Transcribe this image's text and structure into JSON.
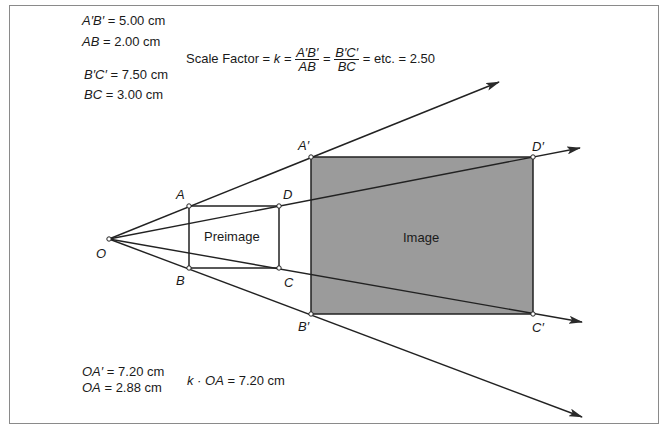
{
  "measurements": {
    "a_prime_b_prime": {
      "label": "A′B′",
      "value": "= 5.00 cm"
    },
    "ab": {
      "label": "AB",
      "value": "= 2.00 cm"
    },
    "b_prime_c_prime": {
      "label": "B′C′",
      "value": "= 7.50 cm"
    },
    "bc": {
      "label": "BC",
      "value": "= 3.00 cm"
    },
    "oa_prime": {
      "label": "OA′",
      "value": "= 7.20 cm"
    },
    "oa": {
      "label": "OA",
      "value": "= 2.88 cm"
    },
    "k_times_oa": {
      "label": "k · OA",
      "value": "= 7.20 cm"
    }
  },
  "scale_factor": {
    "prefix": "Scale Factor =",
    "k": "k",
    "eq": "=",
    "frac1_num": "A′B′",
    "frac1_den": "AB",
    "frac2_num": "B′C′",
    "frac2_den": "BC",
    "suffix": "= etc. = 2.50"
  },
  "points": {
    "O": {
      "label": "O",
      "x": 109,
      "y": 239
    },
    "A": {
      "label": "A",
      "x": 189,
      "y": 206
    },
    "B": {
      "label": "B",
      "x": 189,
      "y": 268
    },
    "C": {
      "label": "C",
      "x": 279,
      "y": 268
    },
    "D": {
      "label": "D",
      "x": 279,
      "y": 206
    },
    "A_prime": {
      "label": "A′",
      "x": 311,
      "y": 157
    },
    "B_prime": {
      "label": "B′",
      "x": 311,
      "y": 314
    },
    "C_prime": {
      "label": "C′",
      "x": 533,
      "y": 314
    },
    "D_prime": {
      "label": "D′",
      "x": 533,
      "y": 157
    }
  },
  "shapes": {
    "preimage_label": "Preimage",
    "image_label": "Image",
    "image_fill": "#9b9b9b"
  }
}
